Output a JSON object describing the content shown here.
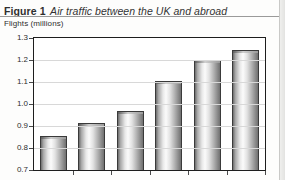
{
  "figure": {
    "label": "Figure 1",
    "caption": "Air traffic between the UK and abroad"
  },
  "axis": {
    "y_caption": "Flights (millions)"
  },
  "chart_data": {
    "type": "bar",
    "title": "Air traffic between the UK and abroad",
    "xlabel": "",
    "ylabel": "Flights (millions)",
    "ylim": [
      0.7,
      1.3
    ],
    "ytick_step": 0.1,
    "ytick_labels": [
      "1.3",
      "1.2",
      "1.1",
      "1.0",
      "0.9",
      "0.8",
      "0.7"
    ],
    "ytick_values": [
      1.3,
      1.2,
      1.1,
      1.0,
      0.9,
      0.8,
      0.7
    ],
    "grid": true,
    "legend": null,
    "categories": [
      "1",
      "2",
      "3",
      "4",
      "5",
      "6"
    ],
    "values": [
      0.865,
      0.925,
      0.977,
      1.115,
      1.21,
      1.255
    ],
    "bar_style": "cylinder",
    "series": [
      {
        "name": "Flights",
        "values": [
          0.865,
          0.925,
          0.977,
          1.115,
          1.21,
          1.255
        ]
      }
    ]
  },
  "colors": {
    "frame": "#1d1d1d",
    "gridline": "#d8d8d8",
    "bar_light": "#fbfbfb",
    "bar_dark": "#6d6d6d",
    "text": "#2e2e2e"
  }
}
